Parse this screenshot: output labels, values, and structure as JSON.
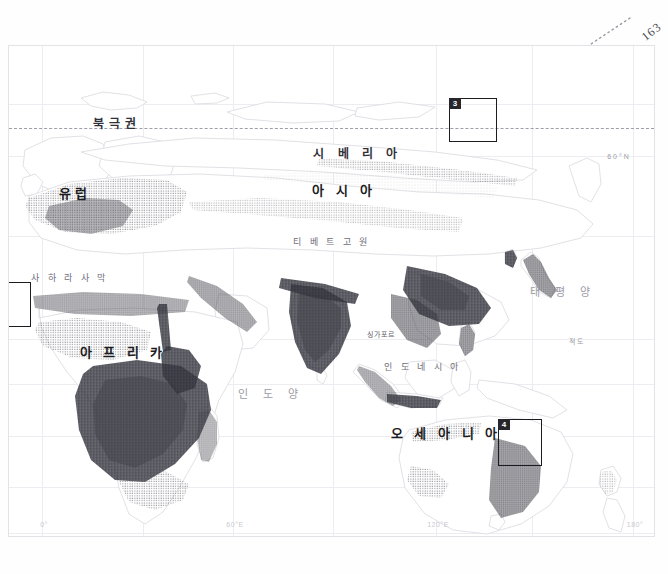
{
  "page": {
    "number": "163",
    "background_color": "#ffffff"
  },
  "map": {
    "title_visible": false,
    "projection_hint": "eastern-hemisphere-world-map",
    "frame_color": "#e3e3e7",
    "dot_color": "#55555e",
    "coastline_color": "#d8d8de",
    "graticule_color": "#ededf1",
    "arctic_circle_label": "북극권",
    "equator_label": "적도",
    "labels": [
      {
        "id": "europe",
        "text": "유럽",
        "kind": "continent",
        "x": 74,
        "y": 191
      },
      {
        "id": "asia",
        "text": "아 시 아",
        "kind": "continent",
        "x": 343,
        "y": 188
      },
      {
        "id": "africa",
        "text": "아 프 리 카",
        "kind": "continent",
        "x": 122,
        "y": 350
      },
      {
        "id": "oceania",
        "text": "오 세 아 니 아",
        "kind": "continent",
        "x": 445,
        "y": 431
      },
      {
        "id": "siberia",
        "text": "시  베  리  아",
        "kind": "region",
        "x": 357,
        "y": 151
      },
      {
        "id": "sahara",
        "text": "사 하 라 사 막",
        "kind": "feature",
        "x": 69,
        "y": 276
      },
      {
        "id": "tibet",
        "text": "티 베 트 고 원",
        "kind": "feature",
        "x": 331,
        "y": 240
      },
      {
        "id": "indonesia",
        "text": "인 도 네 시 아",
        "kind": "feature",
        "x": 422,
        "y": 365
      },
      {
        "id": "singapore",
        "text": "싱가포르",
        "kind": "city",
        "x": 380,
        "y": 333
      },
      {
        "id": "pacific",
        "text": "태 평 양",
        "kind": "ocean",
        "x": 562,
        "y": 290
      },
      {
        "id": "indian",
        "text": "인 도 양",
        "kind": "ocean",
        "x": 270,
        "y": 392
      }
    ],
    "axis_labels": {
      "bottom": [
        {
          "text": "0°",
          "x": 41
        },
        {
          "text": "60°E",
          "x": 232
        },
        {
          "text": "120°E",
          "x": 435
        },
        {
          "text": "180°",
          "x": 632
        }
      ],
      "right": [
        {
          "text": "60°N",
          "y": 155
        },
        {
          "text": "적도",
          "y": 340
        },
        {
          "text": "60°S",
          "y": 546
        }
      ]
    },
    "inset_boxes": [
      {
        "label": "2",
        "x": -18,
        "y": 281,
        "w": 40,
        "h": 45,
        "clipped_left": true
      },
      {
        "label": "3",
        "x": 448,
        "y": 97,
        "w": 48,
        "h": 44,
        "clipped_left": false
      },
      {
        "label": "4",
        "x": 497,
        "y": 418,
        "w": 44,
        "h": 47,
        "clipped_left": false
      }
    ]
  }
}
